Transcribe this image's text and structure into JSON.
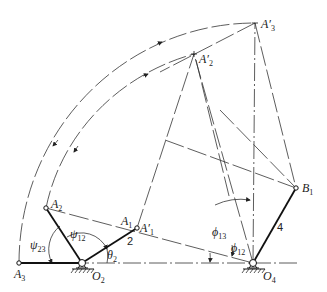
{
  "diagram": {
    "points": {
      "A3": {
        "label": "A",
        "sub": "3"
      },
      "A2": {
        "label": "A",
        "sub": "2"
      },
      "A1": {
        "label": "A",
        "sub": "1"
      },
      "A1p": {
        "label": "A′",
        "sub": "1"
      },
      "A2p": {
        "label": "A′",
        "sub": "2"
      },
      "A3p": {
        "label": "A′",
        "sub": "3"
      },
      "B1": {
        "label": "B",
        "sub": "1"
      },
      "O2": {
        "label": "O",
        "sub": "2"
      },
      "O4": {
        "label": "O",
        "sub": "4"
      }
    },
    "angles": {
      "psi23": {
        "label": "ψ",
        "sub": "23"
      },
      "psi12": {
        "label": "ψ",
        "sub": "12"
      },
      "theta2": {
        "label": "θ",
        "sub": "2"
      },
      "phi13": {
        "label": "ϕ",
        "sub": "13"
      },
      "phi12": {
        "label": "ϕ",
        "sub": "12"
      }
    },
    "links": {
      "link2": "2",
      "link4": "4"
    }
  }
}
